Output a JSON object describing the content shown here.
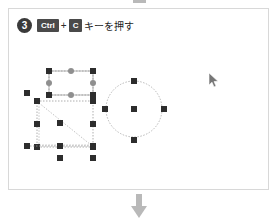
{
  "step": {
    "number": "3",
    "keys": [
      {
        "label": "Ctrl",
        "name": "ctrl"
      },
      {
        "label": "C",
        "name": "c"
      }
    ],
    "separator": "+",
    "instruction": "キーを押す"
  },
  "connectors": {
    "top_arrow": "arrow-down-icon",
    "bottom_arrow": "arrow-down-icon",
    "color": "#b9b9b9"
  },
  "cursor": {
    "icon": "mouse-pointer-icon",
    "x": 205,
    "y": 72
  },
  "colors": {
    "panel_border": "#d8d8d8",
    "handle_dark": "#2d2d2d",
    "handle_gray": "#8f8f8f",
    "selection_dash": "#9a9a9a",
    "shape_stroke": "#a8a8a8",
    "badge": "#3a3a3a",
    "keycap": "#4a4a4a",
    "text": "#1e1e1e"
  },
  "canvas": {
    "label": "drawing-canvas",
    "objects": [
      {
        "name": "rectangle-shape",
        "type": "rect",
        "x": 40,
        "y": 28,
        "width": 44,
        "height": 24,
        "selected": true,
        "handles": [
          {
            "kind": "dark",
            "pos": "nw"
          },
          {
            "kind": "gray",
            "pos": "n"
          },
          {
            "kind": "dark",
            "pos": "ne"
          },
          {
            "kind": "gray",
            "pos": "w"
          },
          {
            "kind": "gray",
            "pos": "e"
          },
          {
            "kind": "dark",
            "pos": "sw"
          },
          {
            "kind": "gray",
            "pos": "s"
          },
          {
            "kind": "dark",
            "pos": "se"
          }
        ]
      },
      {
        "name": "triangle-shape",
        "type": "triangle",
        "x": 28,
        "y": 58,
        "width": 56,
        "height": 46,
        "selected": true
      },
      {
        "name": "line-shape",
        "type": "line",
        "x1": 18,
        "y1": 103,
        "x2": 84,
        "y2": 103,
        "selected": true
      },
      {
        "name": "circle-shape",
        "type": "circle",
        "cx": 125,
        "cy": 66,
        "r": 28,
        "selected": true,
        "handles": [
          {
            "kind": "dark",
            "pos": "n"
          },
          {
            "kind": "dark",
            "pos": "e"
          },
          {
            "kind": "dark",
            "pos": "s"
          },
          {
            "kind": "dark",
            "pos": "w"
          },
          {
            "kind": "dark",
            "pos": "center"
          }
        ]
      }
    ]
  }
}
